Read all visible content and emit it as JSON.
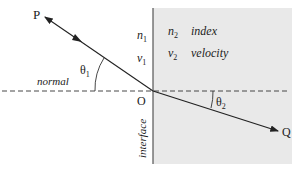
{
  "diagram": {
    "type": "refraction-diagram",
    "points": {
      "P": "P",
      "O": "O",
      "Q": "Q"
    },
    "angles": {
      "incident": {
        "symbol": "θ",
        "sub": "1"
      },
      "refracted": {
        "symbol": "θ",
        "sub": "2"
      }
    },
    "lines": {
      "normal_label": "normal",
      "interface_label": "interface"
    },
    "medium1": {
      "index": {
        "symbol": "n",
        "sub": "1"
      },
      "velocity": {
        "symbol": "v",
        "sub": "1"
      }
    },
    "medium2": {
      "index": {
        "symbol": "n",
        "sub": "2",
        "label": "index"
      },
      "velocity": {
        "symbol": "v",
        "sub": "2",
        "label": "velocity"
      },
      "fill_color": "#e9e9e9"
    }
  }
}
